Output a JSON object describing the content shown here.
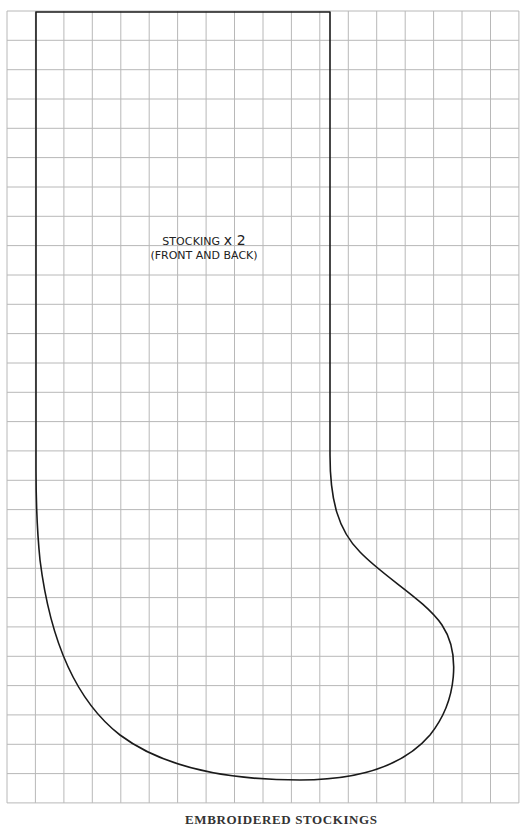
{
  "pattern": {
    "piece_label": "STOCKING",
    "quantity": "x 2",
    "sub_label": "(FRONT AND BACK)",
    "caption": "EMBROIDERED STOCKINGS",
    "page_mark": ""
  },
  "grid": {
    "columns": 18,
    "rows": 27,
    "origin_x": 7,
    "origin_y": 11,
    "cell_width": 28.44,
    "cell_height": 29.33,
    "line_color": "#b8b8b8"
  },
  "outline": {
    "stroke_color": "#1a1a1a",
    "stroke_width": 1.6
  }
}
